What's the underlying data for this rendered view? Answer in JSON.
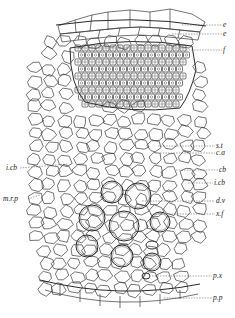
{
  "figure": {
    "labels_right": [
      {
        "id": "e",
        "text": "e",
        "y": 25
      },
      {
        "id": "e2",
        "text": "e",
        "y": 34
      },
      {
        "id": "f",
        "text": "f",
        "y": 50
      },
      {
        "id": "st",
        "text": "s.t",
        "y": 146
      },
      {
        "id": "ca",
        "text": "c.a",
        "y": 153
      },
      {
        "id": "cb",
        "text": "cb",
        "y": 170
      },
      {
        "id": "icb_r",
        "text": "i.cb",
        "y": 183
      },
      {
        "id": "dv",
        "text": "d.v",
        "y": 201
      },
      {
        "id": "xf",
        "text": "x.f",
        "y": 214
      },
      {
        "id": "px",
        "text": "p.x",
        "y": 275
      },
      {
        "id": "pp",
        "text": "p.p",
        "y": 298
      }
    ],
    "labels_left": [
      {
        "id": "icb_l",
        "text": "i.cb",
        "y": 168
      },
      {
        "id": "mrp",
        "text": "m.r.p",
        "y": 199
      }
    ]
  }
}
